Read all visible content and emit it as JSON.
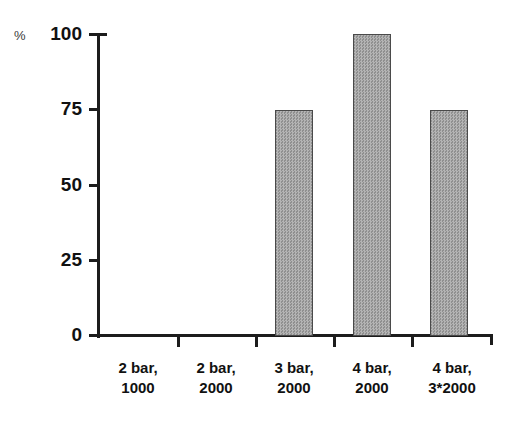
{
  "chart_data": {
    "type": "bar",
    "title": "",
    "subtitle": "",
    "xlabel": "",
    "ylabel": "%",
    "ylim": [
      0,
      100
    ],
    "yticks": [
      0,
      25,
      50,
      75,
      100
    ],
    "ytick_labels": [
      "0",
      "25",
      "50",
      "75",
      "100"
    ],
    "grid": false,
    "legend": null,
    "categories": [
      "2 bar, 1000",
      "2 bar, 2000",
      "3 bar, 2000",
      "4 bar, 2000",
      "4 bar, 3*2000"
    ],
    "category_lines": [
      {
        "line1": "2 bar,",
        "line2": "1000"
      },
      {
        "line1": "2 bar,",
        "line2": "2000"
      },
      {
        "line1": "3 bar,",
        "line2": "2000"
      },
      {
        "line1": "4 bar,",
        "line2": "2000"
      },
      {
        "line1": "4 bar,",
        "line2": "3*2000"
      }
    ],
    "values": [
      0,
      0,
      75,
      100,
      75
    ],
    "series": [
      {
        "name": "",
        "values": [
          0,
          0,
          75,
          100,
          75
        ]
      }
    ],
    "annotations": []
  },
  "style": {
    "bar_fill": "#a3a3a3",
    "bar_stroke": "#4a4a4a",
    "axis_color": "#1c1c1c",
    "text_color": "#111111",
    "background": "#ffffff"
  }
}
